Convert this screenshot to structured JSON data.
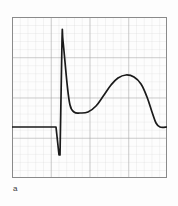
{
  "figure": {
    "panel_label": "a",
    "background_color": "#fdfdfd",
    "border_color": "#8a8a8a",
    "grid_minor_color": "#d6d6d6",
    "grid_major_color": "#9a9a9a",
    "trace_color": "#1a1a1a"
  },
  "chart_data": {
    "type": "line",
    "title": "",
    "subtitle": "",
    "xlabel": "",
    "ylabel": "",
    "grid": true,
    "grid_minor_divisions_per_major": 5,
    "grid_major_count_x": 4,
    "grid_major_count_y": 4,
    "legend": null,
    "annotations": [
      {
        "text": "a",
        "role": "panel-label",
        "x": 0.01,
        "y": -0.06
      }
    ],
    "xlim": [
      0,
      155
    ],
    "ylim": [
      161,
      0
    ],
    "series": [
      {
        "name": "action-potential-trace",
        "color": "#1a1a1a",
        "points": [
          [
            0,
            110
          ],
          [
            36,
            110
          ],
          [
            44,
            110
          ],
          [
            47,
            138
          ],
          [
            48,
            138
          ],
          [
            50,
            24
          ],
          [
            51,
            24
          ],
          [
            55,
            66
          ],
          [
            58,
            88
          ],
          [
            62,
            95
          ],
          [
            68,
            96
          ],
          [
            76,
            95
          ],
          [
            84,
            89
          ],
          [
            92,
            78
          ],
          [
            99,
            68
          ],
          [
            106,
            61
          ],
          [
            114,
            58
          ],
          [
            122,
            60
          ],
          [
            129,
            67
          ],
          [
            135,
            80
          ],
          [
            140,
            95
          ],
          [
            144,
            106
          ],
          [
            148,
            110
          ],
          [
            155,
            110
          ]
        ]
      }
    ]
  }
}
